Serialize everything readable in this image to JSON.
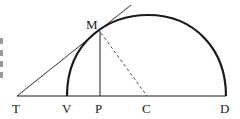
{
  "figure": {
    "colors": {
      "stroke": "#1a1a1a",
      "background": "#ffffff"
    },
    "points": {
      "T": {
        "label": "T",
        "x": 17,
        "y": 96
      },
      "V": {
        "label": "V",
        "x": 67,
        "y": 96
      },
      "P": {
        "label": "P",
        "x": 100,
        "y": 96
      },
      "C": {
        "label": "C",
        "x": 147,
        "y": 96
      },
      "D": {
        "label": "D",
        "x": 225,
        "y": 96
      },
      "M": {
        "label": "M",
        "x": 100,
        "y": 32
      }
    },
    "segments": [
      {
        "name": "baseline-TD",
        "from": "T",
        "to": "D",
        "style": "solid"
      },
      {
        "name": "tangent-TM",
        "from": "T",
        "to": "M",
        "style": "solid",
        "extends_beyond": true
      },
      {
        "name": "ordinate-MP",
        "from": "M",
        "to": "P",
        "style": "solid"
      },
      {
        "name": "radius-MC",
        "from": "M",
        "to": "C",
        "style": "dashed"
      }
    ],
    "arc": {
      "name": "semicircle-VD",
      "from": "V",
      "to": "D",
      "style": "bold"
    }
  }
}
